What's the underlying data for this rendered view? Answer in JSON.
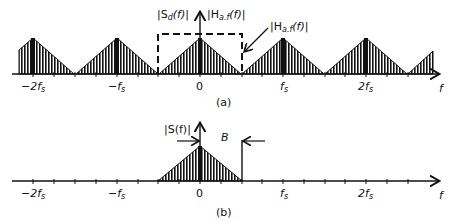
{
  "panel_a": {
    "caption": "(a)",
    "ticks": [
      {
        "label": "−2f",
        "sub": "s"
      },
      {
        "label": "−f",
        "sub": "s"
      },
      {
        "label": "0",
        "sub": ""
      },
      {
        "label": "f",
        "sub": "s"
      },
      {
        "label": "2f",
        "sub": "s"
      }
    ],
    "axis_label": "f",
    "label_sd": "|S",
    "label_sd_sub": "d",
    "label_sd_tail": "(f)|",
    "label_haf_top": "|H",
    "label_haf_top_sub": "a.f",
    "label_haf_top_tail": "(f)|",
    "label_haf_arrow": "|H",
    "label_haf_arrow_sub": "a.f",
    "label_haf_arrow_tail": "(f)|"
  },
  "panel_b": {
    "caption": "(b)",
    "ticks": [
      {
        "label": "−2f",
        "sub": "s"
      },
      {
        "label": "−f",
        "sub": "s"
      },
      {
        "label": "0",
        "sub": ""
      },
      {
        "label": "f",
        "sub": "s"
      },
      {
        "label": "2f",
        "sub": "s"
      }
    ],
    "axis_label": "f",
    "label_s": "|S(f)|",
    "label_b": "B"
  }
}
